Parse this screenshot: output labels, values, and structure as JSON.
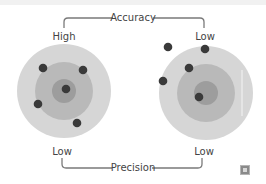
{
  "diagram": {
    "top_label": "Accuracy",
    "bottom_label": "Precision",
    "left_target": {
      "accuracy_label": "High",
      "precision_label": "Low",
      "center": [
        64,
        91
      ],
      "hits": [
        [
          43,
          68
        ],
        [
          83,
          70
        ],
        [
          66,
          89
        ],
        [
          38,
          104
        ],
        [
          77,
          123
        ]
      ]
    },
    "right_target": {
      "accuracy_label": "Low",
      "precision_label": "Low",
      "center": [
        206,
        93
      ],
      "hits": [
        [
          168,
          47
        ],
        [
          205,
          49
        ],
        [
          189,
          68
        ],
        [
          163,
          81
        ],
        [
          199,
          97
        ]
      ]
    },
    "colors": {
      "ring_outer": "#d6d6d6",
      "ring_middle": "#b9b9b9",
      "ring_inner": "#9d9d9d",
      "hit": "#3a3a3a",
      "bracket": "#7a7a7a",
      "text": "#444444"
    },
    "corner_icon": "expand-icon"
  }
}
